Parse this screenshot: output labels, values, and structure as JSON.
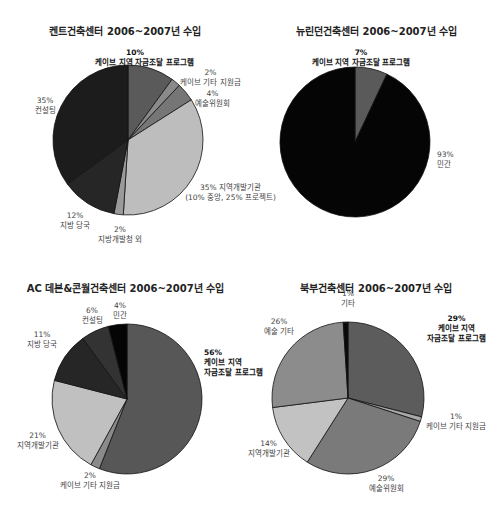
{
  "chart_data": [
    {
      "type": "pie",
      "title": "켄트건축센터 2006~2007년 수입",
      "labels": [
        "케이브 지역 자금조달 프로그램",
        "케이브 기타 지원금",
        "예술위원회",
        "지역개발기관 (10% 중앙, 25% 프로젝트)",
        "지방개발청 외",
        "지방 당국",
        "컨설팅"
      ],
      "values": [
        10,
        2,
        4,
        35,
        2,
        12,
        35
      ],
      "colors": [
        "#5a5a5a",
        "#8a8a8a",
        "#767676",
        "#bdbdbd",
        "#9a9a9a",
        "#262626",
        "#1c1c1c"
      ],
      "start_angle": 0,
      "direction": "clockwise"
    },
    {
      "type": "pie",
      "title": "뉴린던건축센터 2006~2007년 수입",
      "labels": [
        "케이브 지역 자금조달 프로그램",
        "민간"
      ],
      "values": [
        7,
        93
      ],
      "colors": [
        "#5a5a5a",
        "#050505"
      ],
      "start_angle": 0,
      "direction": "clockwise"
    },
    {
      "type": "pie",
      "title": "AC 데본&콘월건축센터 2006~2007년 수입",
      "labels": [
        "케이브 지역 자금조달 프로그램",
        "케이브 기타 지원금",
        "지역개발기관",
        "지방 당국",
        "컨설팅",
        "민간"
      ],
      "values": [
        56,
        2,
        21,
        11,
        6,
        4
      ],
      "colors": [
        "#575757",
        "#8a8a8a",
        "#c0c0c0",
        "#262626",
        "#333333",
        "#050505"
      ],
      "start_angle": 0,
      "direction": "clockwise"
    },
    {
      "type": "pie",
      "title": "북부건축센터 2006~2007년 수입",
      "labels": [
        "케이브 지역 자금조달 프로그램",
        "케이브 기타 지원금",
        "예술위원회",
        "지역개발기관",
        "예술 기타",
        "기타"
      ],
      "values": [
        29,
        1,
        29,
        14,
        26,
        1
      ],
      "colors": [
        "#5c5c5c",
        "#a8a8a8",
        "#7a7a7a",
        "#c2c2c2",
        "#8c8c8c",
        "#0a0a0a"
      ],
      "start_angle": 0,
      "direction": "clockwise"
    }
  ],
  "panels": {
    "kent": {
      "title": "켄트건축센터 2006~2007년 수입",
      "labels": {
        "cave_regional_pct": "10%",
        "cave_regional": "케이브 지역 자금조달 프로그램",
        "cave_other_pct": "2%",
        "cave_other": "케이브 기타 지원금",
        "arts_council_pct": "4%",
        "arts_council": "예술위원회",
        "rda_line1": "35% 지역개발기관",
        "rda_line2": "(10% 중앙, 25% 프로젝트)",
        "dev_agency_pct": "2%",
        "dev_agency": "지방개발청 외",
        "local_auth_pct": "12%",
        "local_auth": "지방 당국",
        "consulting_pct": "35%",
        "consulting": "컨설팅"
      }
    },
    "newlyn": {
      "title": "뉴린던건축센터 2006~2007년 수입",
      "labels": {
        "cave_regional_pct": "7%",
        "cave_regional": "케이브 지역 자금조달 프로그램",
        "private_pct": "93%",
        "private": "민간"
      }
    },
    "ac": {
      "title": "AC 데본&콘월건축센터 2006~2007년 수입",
      "labels": {
        "cave_regional_pct": "56%",
        "cave_regional_1": "케이브 지역",
        "cave_regional_2": "자금조달 프로그램",
        "cave_other_pct": "2%",
        "cave_other": "케이브 기타 지원금",
        "rda_pct": "21%",
        "rda": "지역개발기관",
        "local_auth_pct": "11%",
        "local_auth": "지방 당국",
        "consulting_pct": "6%",
        "consulting": "컨설팅",
        "private_pct": "4%",
        "private": "민간"
      }
    },
    "north": {
      "title": "북부건축센터 2006~2007년 수입",
      "labels": {
        "cave_regional_pct": "29%",
        "cave_regional_1": "케이브 지역",
        "cave_regional_2": "자금조달 프로그램",
        "cave_other_pct": "1%",
        "cave_other": "케이브 기타 지원금",
        "arts_council_pct": "29%",
        "arts_council": "예술위원회",
        "rda_pct": "14%",
        "rda": "지역개발기관",
        "arts_other_pct": "26%",
        "arts_other": "예술 기타",
        "other_pct": "1%",
        "other": "기타"
      }
    }
  }
}
